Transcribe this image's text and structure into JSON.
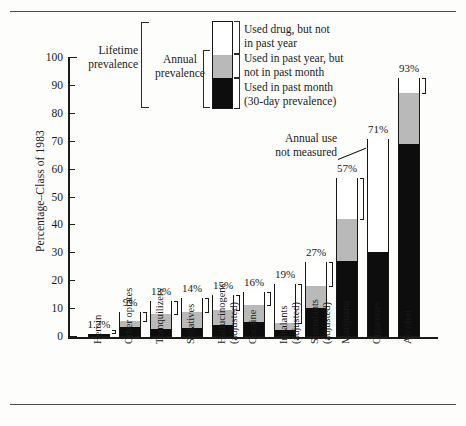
{
  "chart_data": {
    "type": "bar",
    "title": "",
    "xlabel": "",
    "ylabel": "Percentage–Class of 1983",
    "ylim": [
      0,
      100
    ],
    "yticks": [
      0,
      10,
      20,
      30,
      40,
      50,
      60,
      70,
      80,
      90,
      100
    ],
    "grid": false,
    "stacked": true,
    "legend_position": "top-center",
    "categories": [
      "Heroin",
      "Other opiates",
      "Tranquilizers",
      "Sedatives",
      "Hallucinogens (adjusted)",
      "Cocaine",
      "Inhalants (adjusted)",
      "Stimulants (adjusted)",
      "Marijuana",
      "Cigarettes",
      "Alcohol"
    ],
    "category_lines": [
      [
        "Heroin"
      ],
      [
        "Other opiates"
      ],
      [
        "Tranquilizers"
      ],
      [
        "Sedatives"
      ],
      [
        "Hallucinogens",
        "(adjusted)"
      ],
      [
        "Cocaine"
      ],
      [
        "Inhalants",
        "(adjusted)"
      ],
      [
        "Stimulants",
        "(adjusted)"
      ],
      [
        "Marijuana"
      ],
      [
        "Cigarettes"
      ],
      [
        "Alcohol"
      ]
    ],
    "series": [
      {
        "name": "Used in past month (30-day prevalence)",
        "color": "#0d0d0d",
        "values": [
          0.6,
          3.2,
          2.5,
          3.0,
          3.8,
          4.9,
          2.0,
          9.9,
          27.0,
          30.0,
          69.0
        ]
      },
      {
        "name": "Used in past year, but not in past month",
        "color": "#b9b9b9",
        "values": [
          0.5,
          2.1,
          5.5,
          5.5,
          5.4,
          6.3,
          2.8,
          7.9,
          15.0,
          null,
          18.0
        ]
      },
      {
        "name": "Used drug, but not in past year",
        "color": "#ffffff",
        "values": [
          0.1,
          3.7,
          5.0,
          5.5,
          5.8,
          4.8,
          14.2,
          9.2,
          15.0,
          41.0,
          6.0
        ]
      }
    ],
    "totals": [
      1.2,
      9,
      13,
      14,
      15,
      16,
      19,
      27,
      57,
      71,
      93
    ],
    "total_labels": [
      "1.2%",
      "9%",
      "13%",
      "14%",
      "15%",
      "16%",
      "19%",
      "27%",
      "57%",
      "71%",
      "93%"
    ],
    "annual_prevalence": [
      1.1,
      5.3,
      8.0,
      8.5,
      9.2,
      11.2,
      4.8,
      17.8,
      42.0,
      null,
      87.0
    ],
    "annotations": [
      {
        "name": "annual-use-not-measured",
        "lines": [
          "Annual use",
          "not measured"
        ],
        "points_to": "Cigarettes"
      }
    ]
  },
  "legend": {
    "bracket_labels": {
      "lifetime": [
        "Lifetime",
        "prevalence"
      ],
      "annual": [
        "Annual",
        "prevalence"
      ]
    },
    "entries": [
      {
        "key": "life",
        "lines": [
          "Used drug, but not",
          "in past year"
        ],
        "color": "#ffffff"
      },
      {
        "key": "year",
        "lines": [
          "Used in past year, but",
          "not in past month"
        ],
        "color": "#b9b9b9"
      },
      {
        "key": "month",
        "lines": [
          "Used in past month",
          "(30-day prevalence)"
        ],
        "color": "#0d0d0d"
      }
    ]
  },
  "colors": {
    "past_month": "#0d0d0d",
    "past_year": "#b9b9b9",
    "lifetime": "#ffffff",
    "axis": "#1b1b1b",
    "page": "#fdfdfb"
  }
}
